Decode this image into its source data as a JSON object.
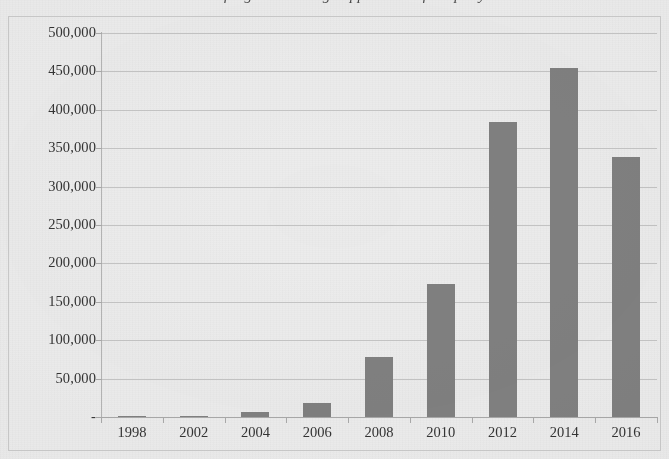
{
  "chart_data": {
    "type": "bar",
    "title": "Number of registered design applications filed per year",
    "title_clipped": true,
    "xlabel": "",
    "ylabel": "",
    "categories": [
      "1998",
      "2002",
      "2004",
      "2006",
      "2008",
      "2010",
      "2012",
      "2014",
      "2016"
    ],
    "values": [
      500,
      1500,
      6500,
      18000,
      78000,
      173000,
      384000,
      455000,
      339000
    ],
    "ylim": [
      0,
      500000
    ],
    "y_ticks": [
      0,
      50000,
      100000,
      150000,
      200000,
      250000,
      300000,
      350000,
      400000,
      450000,
      500000
    ],
    "y_tick_labels": [
      "-",
      "50,000",
      "100,000",
      "150,000",
      "200,000",
      "250,000",
      "300,000",
      "350,000",
      "400,000",
      "450,000",
      "500,000"
    ],
    "grid": true,
    "legend": false,
    "legend_position": "none",
    "series": [
      {
        "name": "Applications",
        "values": [
          500,
          1500,
          6500,
          18000,
          78000,
          173000,
          384000,
          455000,
          339000
        ]
      }
    ],
    "colors": {
      "bar": "#808080",
      "gridline": "#bdbdbd",
      "axis": "#a8a8a8",
      "text": "#333333",
      "background": "#ececec",
      "frame_border": "#c9c9c9"
    }
  }
}
